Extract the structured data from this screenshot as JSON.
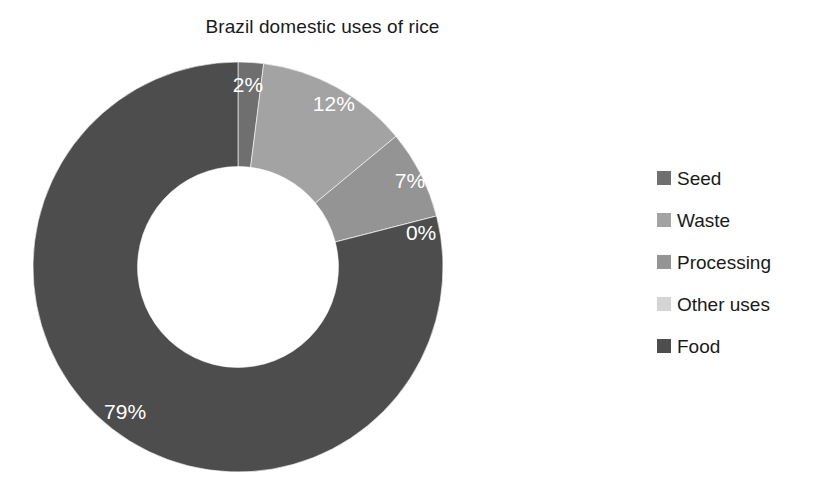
{
  "chart_data": {
    "type": "pie",
    "variant": "doughnut",
    "title": "Brazil domestic uses of rice",
    "xlabel": "",
    "ylabel": "",
    "grid": false,
    "legend_position": "right",
    "start_angle_deg": 0,
    "direction": "clockwise",
    "inner_radius_ratio": 0.49,
    "categories": [
      "Seed",
      "Waste",
      "Processing",
      "Other uses",
      "Food"
    ],
    "values": [
      2,
      12,
      7,
      0,
      79
    ],
    "data_labels": [
      "2%",
      "12%",
      "7%",
      "0%",
      "79%"
    ],
    "colors": [
      "#6f6f6f",
      "#a3a3a3",
      "#949494",
      "#d4d4d4",
      "#4d4d4d"
    ],
    "slices": [
      {
        "name": "Seed",
        "value": 2,
        "label": "2%",
        "color": "#6f6f6f"
      },
      {
        "name": "Waste",
        "value": 12,
        "label": "12%",
        "color": "#a3a3a3"
      },
      {
        "name": "Processing",
        "value": 7,
        "label": "7%",
        "color": "#949494"
      },
      {
        "name": "Other uses",
        "value": 0,
        "label": "0%",
        "color": "#d4d4d4"
      },
      {
        "name": "Food",
        "value": 79,
        "label": "79%",
        "color": "#4d4d4d"
      }
    ]
  },
  "legend": {
    "items": [
      {
        "label": "Seed",
        "color": "#6f6f6f"
      },
      {
        "label": "Waste",
        "color": "#a3a3a3"
      },
      {
        "label": "Processing",
        "color": "#949494"
      },
      {
        "label": "Other uses",
        "color": "#d4d4d4"
      },
      {
        "label": "Food",
        "color": "#4d4d4d"
      }
    ]
  },
  "labels": {
    "seed_pct": "2%",
    "waste_pct": "12%",
    "processing_pct": "7%",
    "other_uses_pct": "0%",
    "food_pct": "79%"
  }
}
